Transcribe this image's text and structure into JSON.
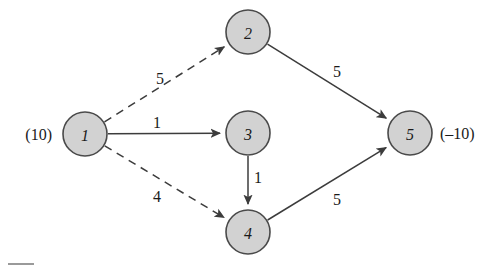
{
  "figure": {
    "colors": {
      "node_fill": "#d2d2d2",
      "node_stroke": "#4a4a4a",
      "edge_stroke": "#3c3c3c",
      "text": "#1a1a1a",
      "background": "#ffffff"
    }
  },
  "chart_data": {
    "type": "diagram",
    "title": "",
    "nodes": [
      {
        "id": "1",
        "label": "1",
        "x": 85,
        "y": 134,
        "r": 22,
        "supply_label": "(10)",
        "supply_value": 10,
        "supply_side": "left"
      },
      {
        "id": "2",
        "label": "2",
        "x": 248,
        "y": 32,
        "r": 22,
        "supply_label": "",
        "supply_value": 0,
        "supply_side": ""
      },
      {
        "id": "3",
        "label": "3",
        "x": 248,
        "y": 133,
        "r": 22,
        "supply_label": "",
        "supply_value": 0,
        "supply_side": ""
      },
      {
        "id": "4",
        "label": "4",
        "x": 248,
        "y": 232,
        "r": 22,
        "supply_label": "",
        "supply_value": 0,
        "supply_side": ""
      },
      {
        "id": "5",
        "label": "5",
        "x": 410,
        "y": 133,
        "r": 22,
        "supply_label": "(–10)",
        "supply_value": -10,
        "supply_side": "right"
      }
    ],
    "edges": [
      {
        "from": "1",
        "to": "2",
        "label": "5",
        "cost": 5,
        "style": "dashed",
        "label_x": 160,
        "label_y": 78
      },
      {
        "from": "1",
        "to": "3",
        "label": "1",
        "cost": 1,
        "style": "solid",
        "label_x": 157,
        "label_y": 122
      },
      {
        "from": "1",
        "to": "4",
        "label": "4",
        "cost": 4,
        "style": "dashed",
        "label_x": 157,
        "label_y": 196
      },
      {
        "from": "2",
        "to": "5",
        "label": "5",
        "cost": 5,
        "style": "solid",
        "label_x": 337,
        "label_y": 71
      },
      {
        "from": "3",
        "to": "4",
        "label": "1",
        "cost": 1,
        "style": "solid",
        "label_x": 258,
        "label_y": 177
      },
      {
        "from": "4",
        "to": "5",
        "label": "5",
        "cost": 5,
        "style": "solid",
        "label_x": 337,
        "label_y": 199
      }
    ],
    "legend": [],
    "annotations": [
      {
        "name": "supply-node-1",
        "text": "(10)",
        "x": 52,
        "y": 134
      },
      {
        "name": "demand-node-5",
        "text": "(–10)",
        "x": 440,
        "y": 133
      }
    ]
  }
}
